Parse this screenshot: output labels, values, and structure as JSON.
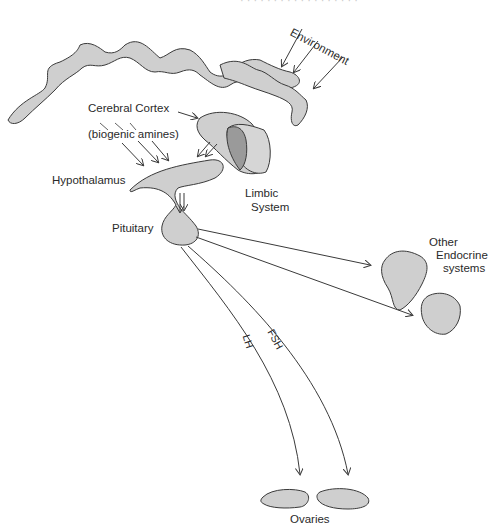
{
  "header": {
    "faint_caption": "· · · · · · · · · · · · · · · · · ·"
  },
  "labels": {
    "environment": "Environment",
    "cerebral_cortex": "Cerebral Cortex",
    "biogenic_amines": "(biogenic amines)",
    "hypothalamus": "Hypothalamus",
    "limbic_line1": "Limbic",
    "limbic_line2": "System",
    "pituitary": "Pituitary",
    "other_line1": "Other",
    "other_line2": "Endocrine",
    "other_line3": "systems",
    "lh": "LH",
    "fsh": "FSH",
    "ovaries": "Ovaries"
  },
  "colors": {
    "fill": "#cfcfcf",
    "fill_dark": "#9a9a9a",
    "stroke": "#3a3a3a"
  }
}
